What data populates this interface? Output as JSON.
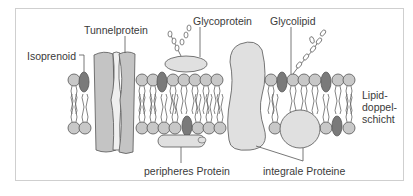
{
  "labels": {
    "tunnelprotein": "Tunnelprotein",
    "isoprenoid": "Isoprenoid",
    "glycoprotein": "Glycoprotein",
    "glycolipid": "Glycolipid",
    "lipid_bilayer_line1": "Lipid-",
    "lipid_bilayer_line2": "doppel-",
    "lipid_bilayer_line3": "schicht",
    "peripheral_protein": "peripheres Protein",
    "integral_proteins": "integrale Proteine"
  },
  "colors": {
    "head_fill": "#c8c8c8",
    "protein_fill": "#e0e0e0",
    "tunnel_side_fill": "#c4c4c4",
    "tunnel_core_fill": "#efefef",
    "sterol_fill": "#7a7a7a",
    "stroke": "#555555",
    "frame": "#cfcfcf"
  }
}
